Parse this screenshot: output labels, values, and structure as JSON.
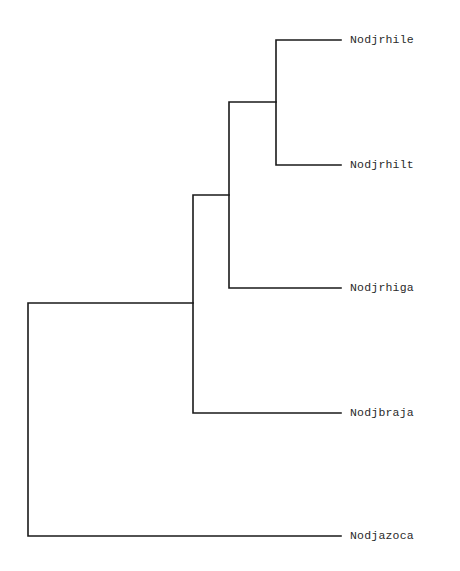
{
  "diagram": {
    "type": "dendrogram",
    "line_color": "#1a1a1a",
    "leaves": [
      {
        "label": "Nodjrhile",
        "y": 40
      },
      {
        "label": "Nodjrhilt",
        "y": 165
      },
      {
        "label": "Nodjrhiga",
        "y": 288
      },
      {
        "label": "Nodjbraja",
        "y": 413
      },
      {
        "label": "Nodjazoca",
        "y": 536
      }
    ],
    "clades": [
      {
        "members": [
          "Nodjrhile",
          "Nodjrhilt"
        ],
        "x": 276
      },
      {
        "members": [
          "Nodjrhile",
          "Nodjrhilt",
          "Nodjrhiga"
        ],
        "x": 229
      },
      {
        "members": [
          "Nodjrhile",
          "Nodjrhilt",
          "Nodjrhiga",
          "Nodjbraja"
        ],
        "x": 193
      },
      {
        "members": [
          "Nodjrhile",
          "Nodjrhilt",
          "Nodjrhiga",
          "Nodjbraja",
          "Nodjazoca"
        ],
        "x": 28
      }
    ]
  }
}
